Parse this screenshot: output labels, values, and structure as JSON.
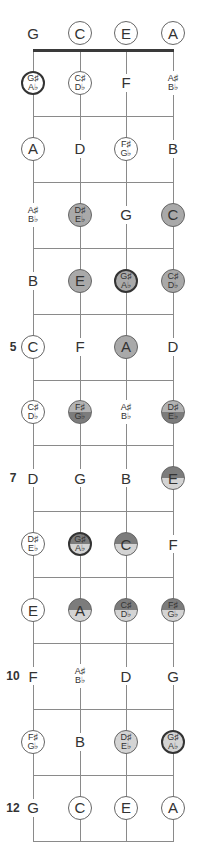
{
  "diagram": {
    "strings": [
      "G",
      "C",
      "E",
      "A"
    ],
    "string_x": [
      33,
      80,
      126,
      173
    ],
    "nut_y": 50,
    "fret_spacing": 65.9,
    "num_frets": 12,
    "open_y": 33,
    "colors": {
      "line": "#8a8a8a",
      "nut": "#3a3a3a",
      "gray": "#a9a9a9",
      "light": "#d4d4d4",
      "dark": "#7c7c7c",
      "mid": "#b3b3b3",
      "white": "#ffffff"
    },
    "fret_markers": [
      {
        "fret": 5,
        "label": "5"
      },
      {
        "fret": 7,
        "label": "7"
      },
      {
        "fret": 10,
        "label": "10"
      },
      {
        "fret": 12,
        "label": "12"
      }
    ],
    "rows": [
      {
        "fret": 0,
        "notes": [
          {
            "label": [
              "G"
            ],
            "style": "none"
          },
          {
            "label": [
              "C"
            ],
            "style": "circle"
          },
          {
            "label": [
              "E"
            ],
            "style": "circle"
          },
          {
            "label": [
              "A"
            ],
            "style": "circle"
          }
        ]
      },
      {
        "fret": 1,
        "notes": [
          {
            "label": [
              "G♯",
              "A♭"
            ],
            "style": "circle-thick"
          },
          {
            "label": [
              "C♯",
              "D♭"
            ],
            "style": "circle"
          },
          {
            "label": [
              "F"
            ],
            "style": "none"
          },
          {
            "label": [
              "A♯",
              "B♭"
            ],
            "style": "none"
          }
        ]
      },
      {
        "fret": 2,
        "notes": [
          {
            "label": [
              "A"
            ],
            "style": "circle"
          },
          {
            "label": [
              "D"
            ],
            "style": "none"
          },
          {
            "label": [
              "F♯",
              "G♭"
            ],
            "style": "circle"
          },
          {
            "label": [
              "B"
            ],
            "style": "none"
          }
        ]
      },
      {
        "fret": 3,
        "notes": [
          {
            "label": [
              "A♯",
              "B♭"
            ],
            "style": "none"
          },
          {
            "label": [
              "D♯",
              "E♭"
            ],
            "style": "gray"
          },
          {
            "label": [
              "G"
            ],
            "style": "none"
          },
          {
            "label": [
              "C"
            ],
            "style": "gray"
          }
        ]
      },
      {
        "fret": 4,
        "notes": [
          {
            "label": [
              "B"
            ],
            "style": "none"
          },
          {
            "label": [
              "E"
            ],
            "style": "gray"
          },
          {
            "label": [
              "G♯",
              "A♭"
            ],
            "style": "gray-thick"
          },
          {
            "label": [
              "C♯",
              "D♭"
            ],
            "style": "gray"
          }
        ]
      },
      {
        "fret": 5,
        "notes": [
          {
            "label": [
              "C"
            ],
            "style": "circle"
          },
          {
            "label": [
              "F"
            ],
            "style": "none"
          },
          {
            "label": [
              "A"
            ],
            "style": "gray"
          },
          {
            "label": [
              "D"
            ],
            "style": "none"
          }
        ]
      },
      {
        "fret": 6,
        "notes": [
          {
            "label": [
              "C♯",
              "D♭"
            ],
            "style": "circle"
          },
          {
            "label": [
              "F♯",
              "G♭"
            ],
            "style": "split-mid-dark"
          },
          {
            "label": [
              "A♯",
              "B♭"
            ],
            "style": "none"
          },
          {
            "label": [
              "D♯",
              "E♭"
            ],
            "style": "split-mid-dark"
          }
        ]
      },
      {
        "fret": 7,
        "notes": [
          {
            "label": [
              "D"
            ],
            "style": "none"
          },
          {
            "label": [
              "G"
            ],
            "style": "none"
          },
          {
            "label": [
              "B"
            ],
            "style": "none"
          },
          {
            "label": [
              "E"
            ],
            "style": "split-dark-light"
          }
        ]
      },
      {
        "fret": 8,
        "notes": [
          {
            "label": [
              "D♯",
              "E♭"
            ],
            "style": "circle"
          },
          {
            "label": [
              "G♯",
              "A♭"
            ],
            "style": "split-dark-light-thick"
          },
          {
            "label": [
              "C"
            ],
            "style": "split-dark-light"
          },
          {
            "label": [
              "F"
            ],
            "style": "none"
          }
        ]
      },
      {
        "fret": 9,
        "notes": [
          {
            "label": [
              "E"
            ],
            "style": "circle"
          },
          {
            "label": [
              "A"
            ],
            "style": "split-dark-light"
          },
          {
            "label": [
              "C♯",
              "D♭"
            ],
            "style": "split-dark-light"
          },
          {
            "label": [
              "F♯",
              "G♭"
            ],
            "style": "split-dark-light"
          }
        ]
      },
      {
        "fret": 10,
        "notes": [
          {
            "label": [
              "F"
            ],
            "style": "none"
          },
          {
            "label": [
              "A♯",
              "B♭"
            ],
            "style": "none"
          },
          {
            "label": [
              "D"
            ],
            "style": "none"
          },
          {
            "label": [
              "G"
            ],
            "style": "none"
          }
        ]
      },
      {
        "fret": 11,
        "notes": [
          {
            "label": [
              "F♯",
              "G♭"
            ],
            "style": "circle"
          },
          {
            "label": [
              "B"
            ],
            "style": "none"
          },
          {
            "label": [
              "D♯",
              "E♭"
            ],
            "style": "light"
          },
          {
            "label": [
              "G♯",
              "A♭"
            ],
            "style": "light-thick"
          }
        ]
      },
      {
        "fret": 12,
        "notes": [
          {
            "label": [
              "G"
            ],
            "style": "none"
          },
          {
            "label": [
              "C"
            ],
            "style": "circle"
          },
          {
            "label": [
              "E"
            ],
            "style": "circle"
          },
          {
            "label": [
              "A"
            ],
            "style": "circle"
          }
        ]
      }
    ]
  }
}
